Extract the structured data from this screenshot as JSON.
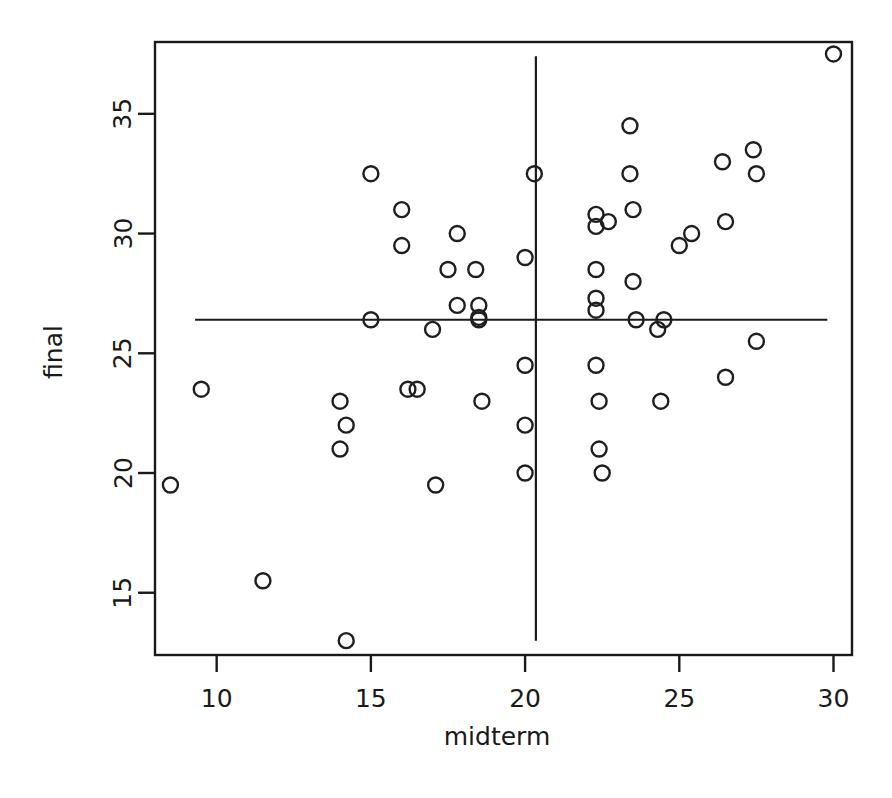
{
  "chart_data": {
    "type": "scatter",
    "title": "",
    "xlabel": "midterm",
    "ylabel": "final",
    "xlim": [
      8.0,
      30.6
    ],
    "ylim": [
      12.4,
      38.0
    ],
    "xticks": [
      10,
      15,
      20,
      25,
      30
    ],
    "yticks": [
      15,
      20,
      25,
      30,
      35
    ],
    "xtick_labels": [
      "10",
      "15",
      "20",
      "25",
      "30"
    ],
    "ytick_labels": [
      "15",
      "20",
      "25",
      "30",
      "35"
    ],
    "grid": false,
    "legend": false,
    "marker": "open-circle",
    "annotations": [
      {
        "name": "horizontal-mean-line",
        "orientation": "horizontal",
        "value": 26.4,
        "x_start": 9.3,
        "x_end": 29.8
      },
      {
        "name": "vertical-mean-line",
        "orientation": "vertical",
        "value": 20.35,
        "y_start": 13.0,
        "y_end": 37.4
      }
    ],
    "x": [
      8.5,
      9.5,
      11.5,
      14.0,
      14.0,
      14.2,
      14.2,
      15.0,
      15.0,
      16.0,
      16.0,
      16.2,
      16.5,
      17.0,
      17.1,
      17.5,
      17.8,
      17.8,
      18.4,
      18.5,
      18.5,
      18.5,
      18.6,
      20.0,
      20.0,
      20.0,
      20.0,
      20.3,
      22.3,
      22.3,
      22.3,
      22.3,
      22.3,
      22.3,
      22.4,
      22.4,
      22.5,
      22.7,
      23.4,
      23.4,
      23.5,
      23.5,
      23.6,
      24.3,
      24.4,
      24.5,
      25.0,
      25.4,
      26.4,
      26.5,
      26.5,
      27.4,
      27.5,
      27.5,
      30.0
    ],
    "y": [
      19.5,
      23.5,
      15.5,
      23.0,
      21.0,
      22.0,
      13.0,
      32.5,
      26.4,
      31.0,
      29.5,
      23.5,
      23.5,
      26.0,
      19.5,
      28.5,
      30.0,
      27.0,
      28.5,
      27.0,
      26.5,
      26.4,
      23.0,
      29.0,
      24.5,
      22.0,
      20.0,
      32.5,
      30.8,
      30.3,
      28.5,
      27.3,
      26.8,
      24.5,
      23.0,
      21.0,
      20.0,
      30.5,
      34.5,
      32.5,
      31.0,
      28.0,
      26.4,
      26.0,
      23.0,
      26.4,
      29.5,
      30.0,
      33.0,
      30.5,
      24.0,
      33.5,
      32.5,
      25.5,
      37.5
    ]
  },
  "axis": {
    "x_title": "midterm",
    "y_title": "final"
  }
}
